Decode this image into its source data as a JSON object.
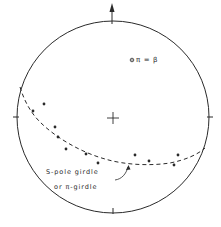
{
  "diagram": {
    "type": "stereonet",
    "colors": {
      "ink": "#2a2a2a",
      "background": "#ffffff"
    },
    "primitive_circle": {
      "cx": 113,
      "cy": 117,
      "r": 96
    },
    "north_arrow": {
      "label": "north-arrow"
    },
    "center_mark": "cross",
    "pi_beta_label": {
      "symbol": "⊙",
      "text": "π = β"
    },
    "girdle_label": {
      "line1": "S-pole girdle",
      "line2": "or π-girdle"
    },
    "poles": [
      [
        33,
        111
      ],
      [
        44,
        104
      ],
      [
        55,
        127
      ],
      [
        58,
        137
      ],
      [
        66,
        149
      ],
      [
        86,
        154
      ],
      [
        98,
        163
      ],
      [
        135,
        155
      ],
      [
        149,
        161
      ],
      [
        178,
        155
      ],
      [
        174,
        165
      ]
    ]
  }
}
